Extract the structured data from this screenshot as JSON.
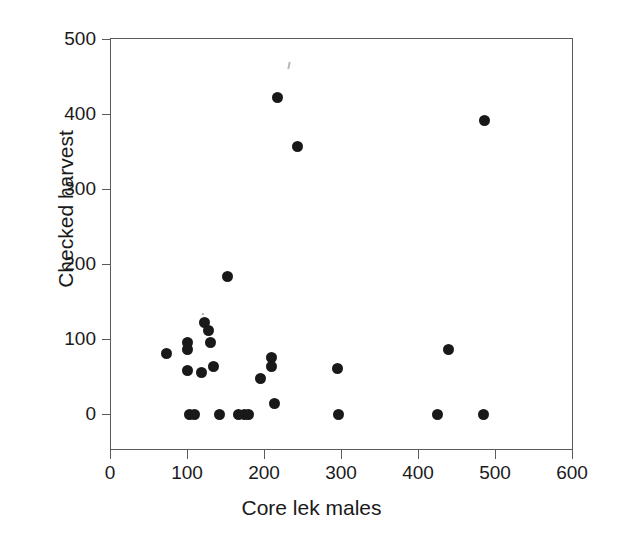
{
  "chart_data": {
    "type": "scatter",
    "title": "",
    "subtitle": "",
    "xlabel": "Core lek males",
    "ylabel": "Checked harvest",
    "xlim": [
      0,
      600
    ],
    "ylim": [
      0,
      500
    ],
    "xticks": [
      0,
      100,
      200,
      300,
      400,
      500,
      600
    ],
    "yticks": [
      0,
      100,
      200,
      300,
      400,
      500
    ],
    "xtick_labels": [
      "0",
      "100",
      "200",
      "300",
      "400",
      "500",
      "600"
    ],
    "ytick_labels": [
      "0",
      "100",
      "200",
      "300",
      "400",
      "500"
    ],
    "grid": false,
    "legend": null,
    "marker": {
      "shape": "circle",
      "filled": true,
      "color": "#191919",
      "size_px": 11
    },
    "axis_color": "#5a5a5a",
    "frame": "box",
    "points": [
      {
        "x": 73,
        "y": 81
      },
      {
        "x": 100,
        "y": 95
      },
      {
        "x": 101,
        "y": 86
      },
      {
        "x": 100,
        "y": 58
      },
      {
        "x": 103,
        "y": 0
      },
      {
        "x": 110,
        "y": 0
      },
      {
        "x": 119,
        "y": 56
      },
      {
        "x": 123,
        "y": 122
      },
      {
        "x": 128,
        "y": 111
      },
      {
        "x": 131,
        "y": 96
      },
      {
        "x": 134,
        "y": 63
      },
      {
        "x": 142,
        "y": 0
      },
      {
        "x": 152,
        "y": 184
      },
      {
        "x": 167,
        "y": 0
      },
      {
        "x": 175,
        "y": 0
      },
      {
        "x": 180,
        "y": 0
      },
      {
        "x": 195,
        "y": 48
      },
      {
        "x": 210,
        "y": 76
      },
      {
        "x": 210,
        "y": 63
      },
      {
        "x": 213,
        "y": 14
      },
      {
        "x": 217,
        "y": 422
      },
      {
        "x": 243,
        "y": 357
      },
      {
        "x": 296,
        "y": 61
      },
      {
        "x": 297,
        "y": 0
      },
      {
        "x": 425,
        "y": 0
      },
      {
        "x": 440,
        "y": 86
      },
      {
        "x": 485,
        "y": 0
      },
      {
        "x": 487,
        "y": 391
      }
    ]
  },
  "figure": {
    "background": "#ffffff"
  }
}
